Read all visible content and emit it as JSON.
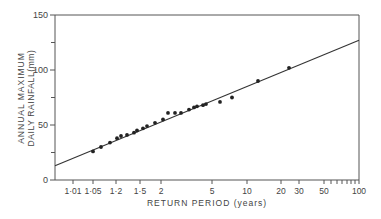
{
  "chart_data": {
    "type": "scatter",
    "title": "",
    "xlabel": "RETURN PERIOD (years)",
    "ylabel_lines": [
      "ANNUAL MAXIMUM",
      "DAILY RAINFALL(mm)"
    ],
    "ylim": [
      0,
      150
    ],
    "xscale": "gumbel (extreme value probability)",
    "y_ticks": [
      0,
      50,
      100,
      150
    ],
    "y_minor_ticks": [
      25,
      75,
      125
    ],
    "x_ticks": [
      {
        "label": "1·01",
        "px": 73
      },
      {
        "label": "1·05",
        "px": 93
      },
      {
        "label": "1·2",
        "px": 116
      },
      {
        "label": "1·5",
        "px": 140
      },
      {
        "label": "2",
        "px": 161
      },
      {
        "label": "5",
        "px": 212
      },
      {
        "label": "10",
        "px": 247
      },
      {
        "label": "20",
        "px": 281
      },
      {
        "label": "30",
        "px": 299
      },
      {
        "label": "50",
        "px": 324
      },
      {
        "label": "100",
        "px": 359
      }
    ],
    "x_minor_ticks_px": [
      331,
      337,
      342,
      347,
      351,
      355
    ],
    "grid": false,
    "points": [
      {
        "px": 93,
        "y": 26
      },
      {
        "px": 101,
        "y": 30
      },
      {
        "px": 110,
        "y": 34
      },
      {
        "px": 117,
        "y": 38
      },
      {
        "px": 121,
        "y": 40
      },
      {
        "px": 127,
        "y": 41
      },
      {
        "px": 134,
        "y": 43
      },
      {
        "px": 137,
        "y": 45
      },
      {
        "px": 143,
        "y": 47
      },
      {
        "px": 147,
        "y": 49
      },
      {
        "px": 155,
        "y": 52
      },
      {
        "px": 163,
        "y": 55
      },
      {
        "px": 168,
        "y": 61
      },
      {
        "px": 175,
        "y": 61
      },
      {
        "px": 181,
        "y": 61
      },
      {
        "px": 189,
        "y": 64
      },
      {
        "px": 194,
        "y": 66
      },
      {
        "px": 197,
        "y": 67
      },
      {
        "px": 203,
        "y": 68
      },
      {
        "px": 206,
        "y": 69
      },
      {
        "px": 220,
        "y": 71
      },
      {
        "px": 232,
        "y": 75
      },
      {
        "px": 258,
        "y": 90
      },
      {
        "px": 289,
        "y": 102
      }
    ],
    "fit_line": {
      "start": {
        "px": 55,
        "y": 13
      },
      "end": {
        "px": 359,
        "y": 127
      }
    },
    "colors": {
      "axis": "#555555",
      "points": "#222222",
      "line": "#333333"
    }
  }
}
